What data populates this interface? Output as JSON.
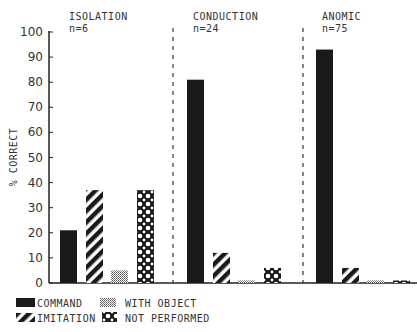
{
  "chart_data": {
    "type": "bar",
    "title": "",
    "xlabel": "",
    "ylabel": "% CORRECT",
    "ylim": [
      0,
      100
    ],
    "yticks": [
      0,
      10,
      20,
      30,
      40,
      50,
      60,
      70,
      80,
      90,
      100
    ],
    "grid": false,
    "legend_position": "bottom-left",
    "groups": [
      {
        "name": "ISOLATION",
        "n_label": "n=6"
      },
      {
        "name": "CONDUCTION",
        "n_label": "n=24"
      },
      {
        "name": "ANOMIC",
        "n_label": "n=75"
      }
    ],
    "categories": [
      "ISOLATION",
      "CONDUCTION",
      "ANOMIC"
    ],
    "series": [
      {
        "name": "COMMAND",
        "pattern": "solid",
        "values": [
          21,
          81,
          93
        ]
      },
      {
        "name": "IMITATION",
        "pattern": "diagonal-stripes",
        "values": [
          37,
          12,
          6
        ]
      },
      {
        "name": "WITH OBJECT",
        "pattern": "fine-dots",
        "values": [
          5,
          1,
          1
        ]
      },
      {
        "name": "NOT PERFORMED",
        "pattern": "crosshatch-circles",
        "values": [
          37,
          6,
          1
        ]
      }
    ]
  },
  "legend": {
    "items": [
      {
        "label": "COMMAND"
      },
      {
        "label": "WITH OBJECT"
      },
      {
        "label": "IMITATION"
      },
      {
        "label": "NOT PERFORMED"
      }
    ]
  },
  "colors": {
    "ink": "#1a1a1a",
    "background": "#ffffff"
  }
}
